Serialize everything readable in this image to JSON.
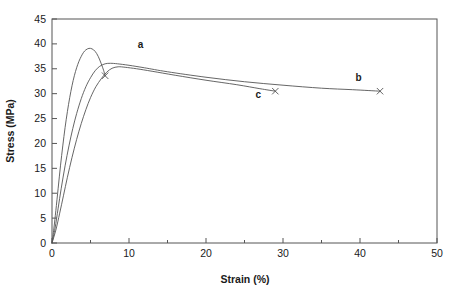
{
  "chart_data": {
    "type": "line",
    "title": "",
    "xlabel": "Strain (%)",
    "ylabel": "Stress (MPa)",
    "xlim": [
      0,
      50
    ],
    "ylim": [
      0,
      45
    ],
    "xticks": [
      0,
      10,
      20,
      30,
      40,
      50
    ],
    "xticks_minor": [
      5,
      15,
      25,
      35,
      45
    ],
    "yticks": [
      0,
      5,
      10,
      15,
      20,
      25,
      30,
      35,
      40,
      45
    ],
    "grid": false,
    "legend": "inline-labels",
    "line_color": "#555555",
    "series": [
      {
        "name": "a",
        "label": "a",
        "label_point": {
          "x": 11.5,
          "y": 39.2
        },
        "end_marker": {
          "x": 6.9,
          "y": 33.6,
          "symbol": "x"
        },
        "points": [
          [
            0.0,
            0.0
          ],
          [
            0.25,
            3.0
          ],
          [
            0.5,
            6.5
          ],
          [
            0.8,
            11.0
          ],
          [
            1.1,
            15.5
          ],
          [
            1.4,
            19.5
          ],
          [
            1.7,
            23.2
          ],
          [
            2.0,
            26.4
          ],
          [
            2.3,
            29.2
          ],
          [
            2.6,
            31.6
          ],
          [
            2.9,
            33.6
          ],
          [
            3.2,
            35.2
          ],
          [
            3.5,
            36.5
          ],
          [
            3.8,
            37.5
          ],
          [
            4.1,
            38.3
          ],
          [
            4.4,
            38.8
          ],
          [
            4.8,
            39.1
          ],
          [
            5.2,
            39.0
          ],
          [
            5.6,
            38.5
          ],
          [
            6.0,
            37.5
          ],
          [
            6.4,
            36.0
          ],
          [
            6.7,
            34.7
          ],
          [
            6.9,
            33.6
          ]
        ]
      },
      {
        "name": "b",
        "label": "b",
        "label_point": {
          "x": 39.8,
          "y": 32.6
        },
        "end_marker": {
          "x": 42.6,
          "y": 30.5,
          "symbol": "x"
        },
        "points": [
          [
            0.0,
            0.0
          ],
          [
            0.4,
            3.0
          ],
          [
            0.8,
            7.0
          ],
          [
            1.2,
            11.0
          ],
          [
            1.7,
            15.5
          ],
          [
            2.2,
            19.5
          ],
          [
            2.7,
            23.0
          ],
          [
            3.2,
            26.0
          ],
          [
            3.8,
            29.0
          ],
          [
            4.4,
            31.4
          ],
          [
            5.0,
            33.2
          ],
          [
            5.6,
            34.6
          ],
          [
            6.2,
            35.5
          ],
          [
            6.9,
            36.0
          ],
          [
            7.6,
            36.1
          ],
          [
            8.5,
            36.0
          ],
          [
            10.0,
            35.7
          ],
          [
            12.0,
            35.2
          ],
          [
            15.0,
            34.4
          ],
          [
            20.0,
            33.3
          ],
          [
            25.0,
            32.4
          ],
          [
            30.0,
            31.7
          ],
          [
            35.0,
            31.1
          ],
          [
            39.0,
            30.8
          ],
          [
            42.6,
            30.5
          ]
        ]
      },
      {
        "name": "c",
        "label": "c",
        "label_point": {
          "x": 26.8,
          "y": 29.2
        },
        "end_marker": {
          "x": 29.0,
          "y": 30.5,
          "symbol": "x"
        },
        "points": [
          [
            0.0,
            0.0
          ],
          [
            0.5,
            2.6
          ],
          [
            1.0,
            6.0
          ],
          [
            1.5,
            9.6
          ],
          [
            2.0,
            13.2
          ],
          [
            2.6,
            17.2
          ],
          [
            3.2,
            20.8
          ],
          [
            3.8,
            24.0
          ],
          [
            4.4,
            26.8
          ],
          [
            5.0,
            29.2
          ],
          [
            5.7,
            31.4
          ],
          [
            6.4,
            33.0
          ],
          [
            7.1,
            34.3
          ],
          [
            7.8,
            35.1
          ],
          [
            8.6,
            35.4
          ],
          [
            9.5,
            35.3
          ],
          [
            11.0,
            35.0
          ],
          [
            13.0,
            34.5
          ],
          [
            16.0,
            33.7
          ],
          [
            20.0,
            32.7
          ],
          [
            24.0,
            31.8
          ],
          [
            27.0,
            31.0
          ],
          [
            29.0,
            30.5
          ]
        ]
      }
    ]
  },
  "axes": {
    "y_tick_labels": [
      "0",
      "5",
      "10",
      "15",
      "20",
      "25",
      "30",
      "35",
      "40",
      "45"
    ],
    "x_tick_labels": [
      "0",
      "10",
      "20",
      "30",
      "40",
      "50"
    ],
    "x_title": "Strain (%)",
    "y_title": "Stress (MPa)"
  },
  "annotations": {
    "a": "a",
    "b": "b",
    "c": "c"
  }
}
